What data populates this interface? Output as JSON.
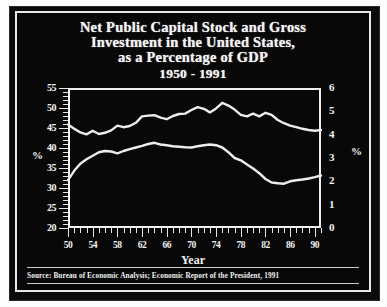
{
  "figure": {
    "title_lines": [
      "Net Public Capital Stock and Gross",
      "Investment in the United States,",
      "as a Percentage of GDP",
      "1950 - 1991"
    ],
    "source": "Source: Bureau of Economic Analysis; Economic Report of the President, 1991",
    "background_color": "#080808",
    "line_color": "#ededed",
    "text_color": "#f4f4f4"
  },
  "chart_data": {
    "type": "line",
    "title": "Net Public Capital Stock and Gross Investment in the United States, as a Percentage of GDP 1950 - 1991",
    "xlabel": "Year",
    "ylabel": "%",
    "y2label": "%",
    "xlim": [
      1950,
      1991
    ],
    "ylim": [
      20,
      55
    ],
    "y2lim": [
      0,
      6
    ],
    "grid": false,
    "legend": "none",
    "xticks": [
      "50",
      "54",
      "58",
      "62",
      "66",
      "70",
      "74",
      "78",
      "82",
      "86",
      "90"
    ],
    "xtick_values": [
      1950,
      1954,
      1958,
      1962,
      1966,
      1970,
      1974,
      1978,
      1982,
      1986,
      1990
    ],
    "yticks": [
      "55",
      "50",
      "45",
      "40",
      "35",
      "30",
      "25",
      "20"
    ],
    "ytick_values": [
      55,
      50,
      45,
      40,
      35,
      30,
      25,
      20
    ],
    "y2ticks": [
      "6",
      "5",
      "4",
      "3",
      "2",
      "1",
      "0"
    ],
    "y2tick_values": [
      6,
      5,
      4,
      3,
      2,
      1,
      0
    ],
    "x": [
      1950,
      1951,
      1952,
      1953,
      1954,
      1955,
      1956,
      1957,
      1958,
      1959,
      1960,
      1961,
      1962,
      1963,
      1964,
      1965,
      1966,
      1967,
      1968,
      1969,
      1970,
      1971,
      1972,
      1973,
      1974,
      1975,
      1976,
      1977,
      1978,
      1979,
      1980,
      1981,
      1982,
      1983,
      1984,
      1985,
      1986,
      1987,
      1988,
      1989,
      1990,
      1991
    ],
    "series": [
      {
        "name": "Net Public Capital Stock",
        "axis": "left",
        "units": "percent of GDP",
        "values": [
          45.9,
          44.8,
          43.9,
          43.4,
          44.3,
          43.5,
          43.8,
          44.4,
          45.6,
          45.2,
          45.5,
          46.3,
          47.9,
          48.1,
          48.2,
          47.6,
          47.2,
          48.0,
          48.5,
          48.6,
          49.5,
          50.2,
          49.8,
          48.9,
          49.9,
          51.3,
          50.6,
          49.6,
          48.3,
          47.9,
          48.6,
          47.9,
          48.8,
          48.3,
          47.0,
          46.2,
          45.6,
          45.2,
          44.8,
          44.5,
          44.3,
          44.5
        ]
      },
      {
        "name": "Gross Public Investment",
        "axis": "right",
        "units": "percent of GDP",
        "values": [
          2.05,
          2.45,
          2.75,
          2.95,
          3.1,
          3.25,
          3.3,
          3.28,
          3.2,
          3.3,
          3.38,
          3.45,
          3.52,
          3.6,
          3.65,
          3.58,
          3.55,
          3.5,
          3.48,
          3.46,
          3.45,
          3.5,
          3.55,
          3.58,
          3.55,
          3.45,
          3.25,
          3.0,
          2.9,
          2.72,
          2.55,
          2.35,
          2.1,
          1.95,
          1.92,
          1.9,
          2.0,
          2.05,
          2.08,
          2.12,
          2.18,
          2.25
        ]
      }
    ]
  }
}
